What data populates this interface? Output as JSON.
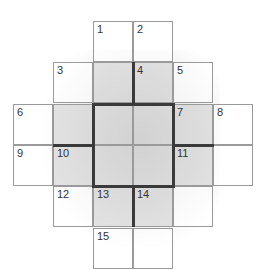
{
  "puzzle": {
    "type": "crossword-grid",
    "rows": 6,
    "cols": 6,
    "cells": [
      {
        "row": 0,
        "col": 2,
        "number": "1",
        "shaded": false
      },
      {
        "row": 0,
        "col": 3,
        "number": "2",
        "shaded": false
      },
      {
        "row": 1,
        "col": 1,
        "number": "3",
        "shaded": false
      },
      {
        "row": 1,
        "col": 2,
        "number": "",
        "shaded": true
      },
      {
        "row": 1,
        "col": 3,
        "number": "4",
        "shaded": true
      },
      {
        "row": 1,
        "col": 4,
        "number": "5",
        "shaded": false
      },
      {
        "row": 2,
        "col": 0,
        "number": "6",
        "shaded": false
      },
      {
        "row": 2,
        "col": 1,
        "number": "",
        "shaded": true
      },
      {
        "row": 2,
        "col": 2,
        "number": "",
        "shaded": true
      },
      {
        "row": 2,
        "col": 3,
        "number": "",
        "shaded": true
      },
      {
        "row": 2,
        "col": 4,
        "number": "7",
        "shaded": true
      },
      {
        "row": 2,
        "col": 5,
        "number": "8",
        "shaded": false
      },
      {
        "row": 3,
        "col": 0,
        "number": "9",
        "shaded": false
      },
      {
        "row": 3,
        "col": 1,
        "number": "10",
        "shaded": true
      },
      {
        "row": 3,
        "col": 2,
        "number": "",
        "shaded": true
      },
      {
        "row": 3,
        "col": 3,
        "number": "",
        "shaded": true
      },
      {
        "row": 3,
        "col": 4,
        "number": "11",
        "shaded": true
      },
      {
        "row": 3,
        "col": 5,
        "number": "",
        "shaded": false
      },
      {
        "row": 4,
        "col": 1,
        "number": "12",
        "shaded": false
      },
      {
        "row": 4,
        "col": 2,
        "number": "13",
        "shaded": true
      },
      {
        "row": 4,
        "col": 3,
        "number": "14",
        "shaded": true
      },
      {
        "row": 4,
        "col": 4,
        "number": "",
        "shaded": false
      },
      {
        "row": 5,
        "col": 2,
        "number": "15",
        "shaded": false
      },
      {
        "row": 5,
        "col": 3,
        "number": "",
        "shaded": false
      }
    ]
  }
}
